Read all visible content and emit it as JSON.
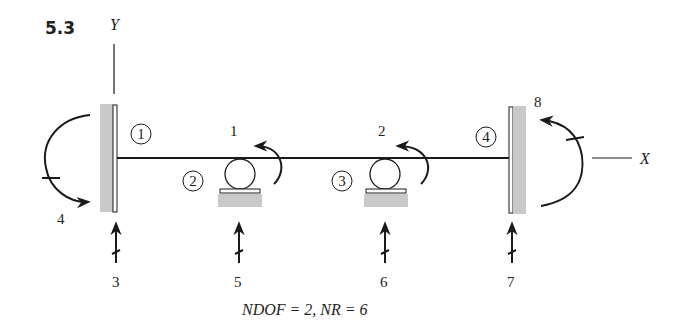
{
  "problem_number": "5.3",
  "axes": {
    "y_label": "Y",
    "x_label": "X"
  },
  "joints": [
    {
      "id": "1",
      "label": "1"
    },
    {
      "id": "2",
      "label": "2"
    },
    {
      "id": "3",
      "label": "3"
    },
    {
      "id": "4",
      "label": "4"
    }
  ],
  "degrees_of_freedom": [
    {
      "number": "1",
      "type": "rotation",
      "joint": "2"
    },
    {
      "number": "2",
      "type": "rotation",
      "joint": "3"
    }
  ],
  "restraints": [
    {
      "number": "3",
      "type": "vertical-reaction",
      "joint": "1"
    },
    {
      "number": "4",
      "type": "moment-reaction",
      "joint": "1"
    },
    {
      "number": "5",
      "type": "vertical-reaction",
      "joint": "2"
    },
    {
      "number": "6",
      "type": "vertical-reaction",
      "joint": "3"
    },
    {
      "number": "7",
      "type": "vertical-reaction",
      "joint": "4"
    },
    {
      "number": "8",
      "type": "moment-reaction",
      "joint": "4"
    }
  ],
  "caption": "NDOF = 2, NR = 6",
  "colors": {
    "line": "#1a1a1a",
    "support_fill": "#c9c9c9",
    "background": "#ffffff"
  }
}
